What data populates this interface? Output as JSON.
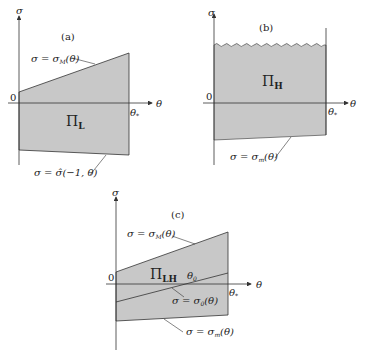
{
  "panels": {
    "a": {
      "tag": "(a)",
      "region": "Π",
      "region_sub": "L",
      "upper_label": "σ = σ",
      "upper_sub": "M",
      "upper_tail": "(θ)",
      "lower_label": "σ = σ̂(−1, θ)",
      "origin": "0",
      "theta_star": "θ",
      "star": "*",
      "x_axis": "θ",
      "y_axis": "σ"
    },
    "b": {
      "tag": "(b)",
      "region": "Π",
      "region_sub": "H",
      "lower_label": "σ = σ",
      "lower_sub": "m",
      "lower_tail": "(θ)",
      "origin": "0",
      "theta_star": "θ",
      "star": "*",
      "x_axis": "θ",
      "y_axis": "σ"
    },
    "c": {
      "tag": "(c)",
      "region": "Π",
      "region_sub": "LH",
      "upper_label": "σ = σ",
      "upper_sub": "M",
      "upper_tail": "(θ)",
      "mid_label": "σ = σ",
      "mid_sub": "0",
      "mid_tail": "(θ)",
      "lower_label": "σ = σ",
      "lower_sub": "m",
      "lower_tail": "(θ)",
      "theta0": "θ",
      "theta0_sub": "0",
      "origin": "0",
      "theta_star": "θ",
      "star": "*",
      "x_axis": "θ",
      "y_axis": "σ"
    }
  },
  "colors": {
    "fill": "#c8c8c8",
    "line": "#333333"
  }
}
